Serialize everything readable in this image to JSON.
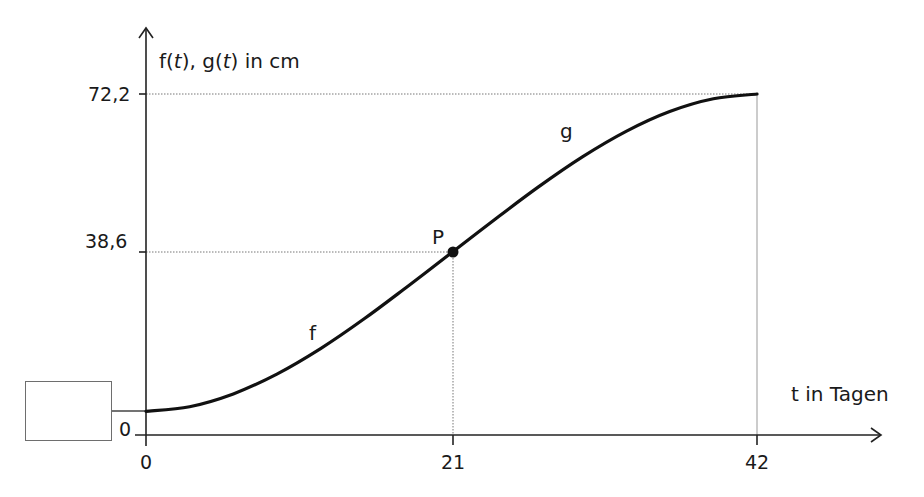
{
  "chart": {
    "ylabel_parts": [
      "f(",
      "t",
      "), g(",
      "t",
      ") in cm"
    ],
    "xlabel": "t in Tagen",
    "y_ticks": [
      "72,2",
      "38,6",
      "0"
    ],
    "x_ticks": [
      "0",
      "21",
      "42"
    ],
    "point_label": "P",
    "curve_f_label": "f",
    "curve_g_label": "g"
  },
  "chart_data": {
    "type": "line",
    "title": "",
    "xlabel": "t in Tagen",
    "ylabel": "f(t), g(t) in cm",
    "xlim": [
      0,
      42
    ],
    "ylim": [
      0,
      72.2
    ],
    "x_ticks": [
      0,
      21,
      42
    ],
    "y_ticks": [
      0,
      38.6,
      72.2
    ],
    "grid": false,
    "legend": "none (curves labeled inline: f, g)",
    "series": [
      {
        "name": "f",
        "x": [
          0,
          3,
          6,
          9,
          12,
          15,
          18,
          21
        ],
        "values": [
          5.0,
          6.0,
          8.7,
          12.9,
          18.3,
          24.6,
          31.5,
          38.6
        ]
      },
      {
        "name": "g",
        "x": [
          21,
          24,
          27,
          30,
          33,
          36,
          39,
          42
        ],
        "values": [
          38.6,
          45.7,
          52.6,
          58.9,
          64.3,
          68.5,
          71.2,
          72.2
        ]
      }
    ],
    "annotations": [
      {
        "label": "P",
        "x": 21,
        "y": 38.6,
        "type": "point",
        "note": "junction of f and g, dotted guides to axes"
      },
      {
        "label": "72,2",
        "x": 42,
        "y": 72.2,
        "type": "dotted guide lines"
      },
      {
        "label": "",
        "type": "empty answer box",
        "note": "blank box at initial value f(0) on y-axis"
      }
    ]
  }
}
